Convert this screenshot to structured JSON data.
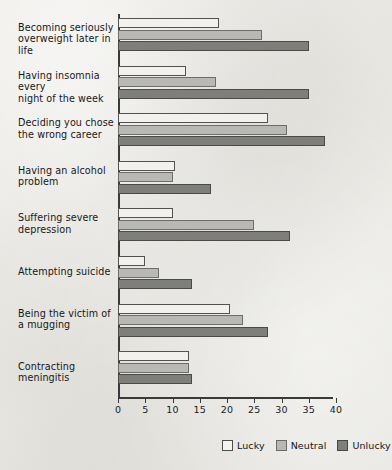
{
  "chart_data": {
    "type": "bar",
    "orientation": "horizontal",
    "grouped": true,
    "title": "",
    "subtitle": "",
    "xlabel": "",
    "ylabel": "",
    "xlim": [
      0,
      40
    ],
    "xticks": [
      0,
      5,
      10,
      15,
      20,
      25,
      30,
      35,
      40
    ],
    "xtick_labels": [
      "0",
      "5",
      "10",
      "15",
      "20",
      "25",
      "30",
      "35",
      "40"
    ],
    "grid": false,
    "legend_position": "bottom-right",
    "categories": [
      "Becoming seriously overweight later in life",
      "Having insomnia every night of the week",
      "Deciding you chose the wrong career",
      "Having an alcohol problem",
      "Suffering severe depression",
      "Attempting suicide",
      "Being the victim of a mugging",
      "Contracting meningitis"
    ],
    "category_lines": [
      [
        "Becoming seriously",
        "overweight later in life"
      ],
      [
        "Having insomnia every",
        "night of the week"
      ],
      [
        "Deciding you chose",
        "the wrong career"
      ],
      [
        "Having an alcohol",
        "problem"
      ],
      [
        "Suffering severe",
        "depression"
      ],
      [
        "Attempting suicide"
      ],
      [
        "Being the victim of",
        "a mugging"
      ],
      [
        "Contracting meningitis"
      ]
    ],
    "series": [
      {
        "name": "Lucky",
        "color": "#f2f1ee",
        "values": [
          18.5,
          12.5,
          27.5,
          10.5,
          10,
          5,
          20.5,
          13
        ]
      },
      {
        "name": "Neutral",
        "color": "#b9b8b4",
        "values": [
          26.5,
          18,
          31,
          10,
          25,
          7.5,
          23,
          13
        ]
      },
      {
        "name": "Unlucky",
        "color": "#7e7e7b",
        "values": [
          35,
          35,
          38,
          17,
          31.5,
          13.5,
          27.5,
          13.5
        ]
      }
    ]
  },
  "legend": {
    "items": [
      {
        "label": "Lucky",
        "swatch": "lucky"
      },
      {
        "label": "Neutral",
        "swatch": "neutral"
      },
      {
        "label": "Unlucky",
        "swatch": "unlucky"
      }
    ]
  },
  "colors": {
    "background": "#e8e7e3",
    "axis": "#3a3a3a",
    "text": "#1c1c1c",
    "lucky": "#f2f1ee",
    "neutral": "#b9b8b4",
    "unlucky": "#7e7e7b"
  }
}
